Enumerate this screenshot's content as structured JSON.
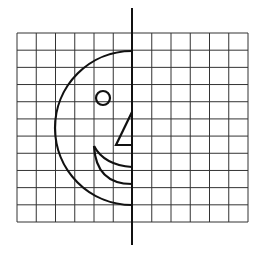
{
  "figure": {
    "title": "Half face on grid with line of symmetry",
    "background": "#ffffff",
    "ink_color": "#111111",
    "grid_color": "#333333"
  },
  "grid": {
    "columns": 12,
    "rows": 11,
    "left": 17,
    "top": 33,
    "right": 248,
    "bottom": 222,
    "line_width": 1
  },
  "symmetry_axis": {
    "label": "line of symmetry",
    "x": 132,
    "y1": 8,
    "y2": 245,
    "stroke_width": 2
  },
  "half_face": {
    "head": {
      "label": "head outline",
      "cx": 132,
      "cy": 128,
      "rx": 77,
      "ry": 77,
      "side": "left"
    },
    "eye": {
      "label": "eye",
      "cx": 103,
      "cy": 98,
      "r": 7
    },
    "nose": {
      "label": "nose",
      "points": [
        [
          132,
          112
        ],
        [
          116,
          145
        ],
        [
          132,
          145
        ]
      ]
    },
    "mouth": {
      "label": "mouth",
      "upper_arc": {
        "start": [
          94,
          146
        ],
        "end": [
          132,
          167
        ]
      },
      "lower_arc": {
        "start": [
          94,
          146
        ],
        "end": [
          132,
          184
        ]
      }
    },
    "stroke_width": 2.2
  }
}
